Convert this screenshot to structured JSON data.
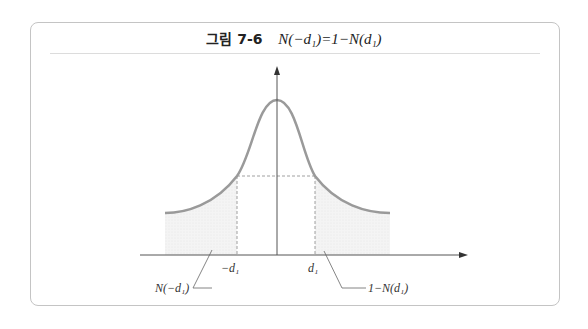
{
  "figure": {
    "label": "그림 7-6",
    "equation": "N(−d₁)=1−N(d₁)"
  },
  "diagram": {
    "type": "normal-distribution",
    "left_tick": "−d₁",
    "right_tick": "d₁",
    "left_area_label": "N(−d₁)",
    "right_area_label": "1−N(d₁)",
    "colors": {
      "curve": "#9a9a9a",
      "axis": "#555555",
      "shade": "#f0f0f0",
      "border": "#c4c4c4"
    }
  }
}
